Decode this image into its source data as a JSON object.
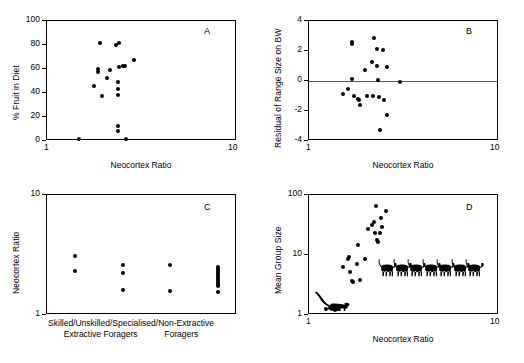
{
  "figure": {
    "background": "#ffffff",
    "marker_color": "#000000",
    "axis_color": "#000000",
    "zero_line_color": "#555555"
  },
  "chart_data": [
    {
      "type": "scatter",
      "panel": "A",
      "title": "",
      "xlabel": "Neocortex Ratio",
      "ylabel": "% Fruit in Diet",
      "xscale": "log",
      "yscale": "linear",
      "xlim": [
        1,
        10
      ],
      "ylim": [
        0,
        100
      ],
      "xticks": [
        1,
        10
      ],
      "xticklabels": [
        "1",
        "10"
      ],
      "yticks": [
        0,
        20,
        40,
        60,
        80,
        100
      ],
      "yticklabels": [
        "0",
        "20",
        "40",
        "60",
        "80",
        "100"
      ],
      "grid": false,
      "legend": "none",
      "points": [
        {
          "x": 1.5,
          "y": 0.5
        },
        {
          "x": 1.78,
          "y": 45.0
        },
        {
          "x": 1.88,
          "y": 59.5
        },
        {
          "x": 1.88,
          "y": 57.0
        },
        {
          "x": 1.93,
          "y": 81.0
        },
        {
          "x": 1.97,
          "y": 37.0
        },
        {
          "x": 2.1,
          "y": 52.0
        },
        {
          "x": 2.18,
          "y": 58.5
        },
        {
          "x": 2.33,
          "y": 79.5
        },
        {
          "x": 2.38,
          "y": 48.0
        },
        {
          "x": 2.38,
          "y": 42.5
        },
        {
          "x": 2.4,
          "y": 37.5
        },
        {
          "x": 2.42,
          "y": 81.0
        },
        {
          "x": 2.43,
          "y": 60.5
        },
        {
          "x": 2.38,
          "y": 12.0
        },
        {
          "x": 2.38,
          "y": 7.5
        },
        {
          "x": 2.55,
          "y": 62.0
        },
        {
          "x": 2.62,
          "y": 62.0
        },
        {
          "x": 2.63,
          "y": 1.0
        },
        {
          "x": 2.92,
          "y": 67.0
        }
      ]
    },
    {
      "type": "scatter",
      "panel": "B",
      "title": "",
      "xlabel": "Neocortex Ratio",
      "ylabel": "Residual of Range Size on BW",
      "xscale": "log",
      "yscale": "linear",
      "xlim": [
        1,
        10
      ],
      "ylim": [
        -4,
        4
      ],
      "xticks": [
        1,
        10
      ],
      "xticklabels": [
        "1",
        "10"
      ],
      "yticks": [
        -4,
        -2,
        0,
        2,
        4
      ],
      "yticklabels": [
        "-4",
        "-2",
        "0",
        "2",
        "4"
      ],
      "grid": false,
      "reference_line_y": 0,
      "legend": "none",
      "points": [
        {
          "x": 1.52,
          "y": -0.95
        },
        {
          "x": 1.62,
          "y": -0.58
        },
        {
          "x": 1.7,
          "y": 2.55
        },
        {
          "x": 1.7,
          "y": 2.4
        },
        {
          "x": 1.71,
          "y": 0.05
        },
        {
          "x": 1.74,
          "y": -1.05
        },
        {
          "x": 1.83,
          "y": -1.25
        },
        {
          "x": 1.85,
          "y": -1.35
        },
        {
          "x": 1.88,
          "y": -1.65
        },
        {
          "x": 2.0,
          "y": 0.65
        },
        {
          "x": 2.05,
          "y": -1.05
        },
        {
          "x": 2.18,
          "y": 1.2
        },
        {
          "x": 2.2,
          "y": -1.05
        },
        {
          "x": 2.22,
          "y": 2.8
        },
        {
          "x": 2.3,
          "y": 2.05
        },
        {
          "x": 2.32,
          "y": 0.95
        },
        {
          "x": 2.33,
          "y": 0.02
        },
        {
          "x": 2.37,
          "y": -1.1
        },
        {
          "x": 2.4,
          "y": -3.35
        },
        {
          "x": 2.48,
          "y": 2.0
        },
        {
          "x": 2.5,
          "y": -1.35
        },
        {
          "x": 2.6,
          "y": 0.9
        },
        {
          "x": 2.62,
          "y": -2.3
        },
        {
          "x": 3.05,
          "y": -0.15
        }
      ]
    },
    {
      "type": "scatter",
      "panel": "C",
      "title": "",
      "xlabel": "",
      "ylabel": "Neocortex Ratio",
      "xscale": "category",
      "yscale": "log",
      "ylim": [
        1,
        10
      ],
      "yticks": [
        1,
        10
      ],
      "yticklabels": [
        "1",
        "10"
      ],
      "grid": false,
      "legend": "none",
      "categories": [
        "Skilled/Extractive Foragers",
        "Unskilled/Extractive Foragers",
        "Specialised/Foragers",
        "Non-Extractive Foragers"
      ],
      "category_label_line1": "Skilled/Unskilled/Specialised/Non-Extractive",
      "category_label_line2_left": "Extractive Foragers",
      "category_label_line2_right": "Foragers",
      "series": [
        {
          "name": "Skilled/Extractive Foragers",
          "values": [
            3.05,
            2.3
          ]
        },
        {
          "name": "Unskilled/Extractive Foragers",
          "values": [
            2.55,
            2.18,
            1.6
          ]
        },
        {
          "name": "Specialised/Foragers",
          "values": [
            2.55,
            1.55
          ]
        },
        {
          "name": "Non-Extractive Foragers",
          "values": [
            2.45,
            2.38,
            2.28,
            2.18,
            2.1,
            2.02,
            1.95,
            1.88,
            1.82,
            1.76,
            1.7,
            1.52
          ]
        }
      ]
    },
    {
      "type": "scatter",
      "panel": "D",
      "title": "",
      "xlabel": "Neocortex Ratio",
      "ylabel": "Mean Group Size",
      "xscale": "log",
      "yscale": "log",
      "xlim": [
        1,
        10
      ],
      "ylim": [
        1,
        100
      ],
      "xticks": [
        1,
        10
      ],
      "xticklabels": [
        "1",
        "10"
      ],
      "yticks": [
        1,
        10,
        100
      ],
      "yticklabels": [
        "1",
        "10",
        "100"
      ],
      "grid": false,
      "legend": "none",
      "annotations": [
        {
          "name": "prosimian-silhouette",
          "x": 1.12,
          "y": 1.75
        },
        {
          "name": "monkey-silhouette-row",
          "count": 7,
          "x_start": 2.55,
          "x_end": 7.3,
          "y": 6.4
        }
      ],
      "points": [
        {
          "x": 1.25,
          "y": 1.2
        },
        {
          "x": 1.3,
          "y": 1.25
        },
        {
          "x": 1.34,
          "y": 1.22
        },
        {
          "x": 1.38,
          "y": 1.18
        },
        {
          "x": 1.43,
          "y": 1.2
        },
        {
          "x": 1.52,
          "y": 6.1
        },
        {
          "x": 1.62,
          "y": 8.4
        },
        {
          "x": 1.64,
          "y": 9.0
        },
        {
          "x": 1.66,
          "y": 5.0
        },
        {
          "x": 1.7,
          "y": 3.6
        },
        {
          "x": 1.72,
          "y": 3.4
        },
        {
          "x": 1.8,
          "y": 6.7
        },
        {
          "x": 1.83,
          "y": 14.0
        },
        {
          "x": 1.88,
          "y": 3.7
        },
        {
          "x": 2.0,
          "y": 8.2
        },
        {
          "x": 2.08,
          "y": 26.0
        },
        {
          "x": 2.18,
          "y": 30.0
        },
        {
          "x": 2.22,
          "y": 34.0
        },
        {
          "x": 2.25,
          "y": 22.0
        },
        {
          "x": 2.28,
          "y": 64.0
        },
        {
          "x": 2.32,
          "y": 17.0
        },
        {
          "x": 2.33,
          "y": 16.0
        },
        {
          "x": 2.38,
          "y": 22.5
        },
        {
          "x": 2.42,
          "y": 40.0
        },
        {
          "x": 2.45,
          "y": 28.0
        },
        {
          "x": 2.58,
          "y": 52.0
        }
      ]
    }
  ],
  "panels": {
    "a": {
      "letter": "A"
    },
    "b": {
      "letter": "B"
    },
    "c": {
      "letter": "C"
    },
    "d": {
      "letter": "D"
    }
  }
}
